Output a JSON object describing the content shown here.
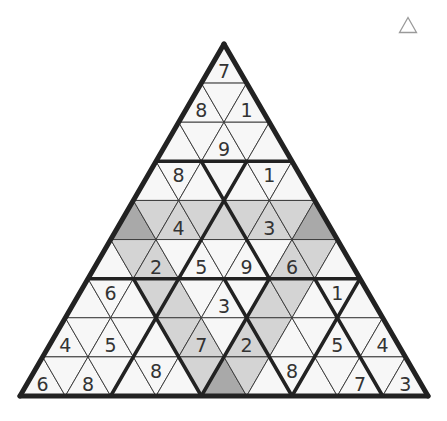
{
  "puzzle": {
    "type": "triangular-sudoku",
    "rows": 9,
    "colors": {
      "white": "#f7f7f7",
      "light": "#d4d4d4",
      "dark": "#a9a9a9",
      "thin_line": "#333333",
      "thick_line": "#222222",
      "digit": "#333333"
    },
    "cells": [
      [
        {
          "v": "7",
          "s": "white"
        }
      ],
      [
        {
          "v": "8",
          "s": "white"
        },
        {
          "v": "",
          "s": "white"
        },
        {
          "v": "1",
          "s": "white"
        }
      ],
      [
        {
          "v": "",
          "s": "white"
        },
        {
          "v": "",
          "s": "white"
        },
        {
          "v": "9",
          "s": "white"
        },
        {
          "v": "",
          "s": "white"
        },
        {
          "v": "",
          "s": "white"
        }
      ],
      [
        {
          "v": "",
          "s": "white"
        },
        {
          "v": "8",
          "s": "white"
        },
        {
          "v": "",
          "s": "white"
        },
        {
          "v": "",
          "s": "white"
        },
        {
          "v": "",
          "s": "white"
        },
        {
          "v": "1",
          "s": "white"
        },
        {
          "v": "",
          "s": "white"
        }
      ],
      [
        {
          "v": "",
          "s": "dark"
        },
        {
          "v": "",
          "s": "light"
        },
        {
          "v": "4",
          "s": "light"
        },
        {
          "v": "",
          "s": "light"
        },
        {
          "v": "",
          "s": "light"
        },
        {
          "v": "",
          "s": "light"
        },
        {
          "v": "3",
          "s": "light"
        },
        {
          "v": "",
          "s": "light"
        },
        {
          "v": "",
          "s": "dark"
        }
      ],
      [
        {
          "v": "",
          "s": "white"
        },
        {
          "v": "",
          "s": "light"
        },
        {
          "v": "2",
          "s": "light"
        },
        {
          "v": "",
          "s": "white"
        },
        {
          "v": "5",
          "s": "white"
        },
        {
          "v": "",
          "s": "white"
        },
        {
          "v": "9",
          "s": "white"
        },
        {
          "v": "",
          "s": "white"
        },
        {
          "v": "6",
          "s": "light"
        },
        {
          "v": "",
          "s": "light"
        },
        {
          "v": "",
          "s": "white"
        }
      ],
      [
        {
          "v": "",
          "s": "white"
        },
        {
          "v": "6",
          "s": "white"
        },
        {
          "v": "",
          "s": "white"
        },
        {
          "v": "",
          "s": "light"
        },
        {
          "v": "",
          "s": "light"
        },
        {
          "v": "",
          "s": "white"
        },
        {
          "v": "3",
          "s": "white"
        },
        {
          "v": "",
          "s": "white"
        },
        {
          "v": "",
          "s": "light"
        },
        {
          "v": "",
          "s": "light"
        },
        {
          "v": "",
          "s": "white"
        },
        {
          "v": "1",
          "s": "white"
        },
        {
          "v": "",
          "s": "white"
        }
      ],
      [
        {
          "v": "4",
          "s": "white"
        },
        {
          "v": "",
          "s": "white"
        },
        {
          "v": "5",
          "s": "white"
        },
        {
          "v": "",
          "s": "white"
        },
        {
          "v": "",
          "s": "white"
        },
        {
          "v": "",
          "s": "light"
        },
        {
          "v": "7",
          "s": "light"
        },
        {
          "v": "",
          "s": "white"
        },
        {
          "v": "2",
          "s": "light"
        },
        {
          "v": "",
          "s": "light"
        },
        {
          "v": "",
          "s": "white"
        },
        {
          "v": "",
          "s": "white"
        },
        {
          "v": "5",
          "s": "white"
        },
        {
          "v": "",
          "s": "white"
        },
        {
          "v": "4",
          "s": "white"
        }
      ],
      [
        {
          "v": "6",
          "s": "white"
        },
        {
          "v": "",
          "s": "white"
        },
        {
          "v": "8",
          "s": "white"
        },
        {
          "v": "",
          "s": "white"
        },
        {
          "v": "",
          "s": "white"
        },
        {
          "v": "8",
          "s": "white"
        },
        {
          "v": "",
          "s": "white"
        },
        {
          "v": "",
          "s": "light"
        },
        {
          "v": "",
          "s": "dark"
        },
        {
          "v": "",
          "s": "light"
        },
        {
          "v": "",
          "s": "white"
        },
        {
          "v": "8",
          "s": "white"
        },
        {
          "v": "",
          "s": "white"
        },
        {
          "v": "",
          "s": "white"
        },
        {
          "v": "7",
          "s": "white"
        },
        {
          "v": "",
          "s": "white"
        },
        {
          "v": "3",
          "s": "white"
        }
      ]
    ]
  },
  "toolbar": {
    "corner_icon": "triangle-outline-icon"
  }
}
